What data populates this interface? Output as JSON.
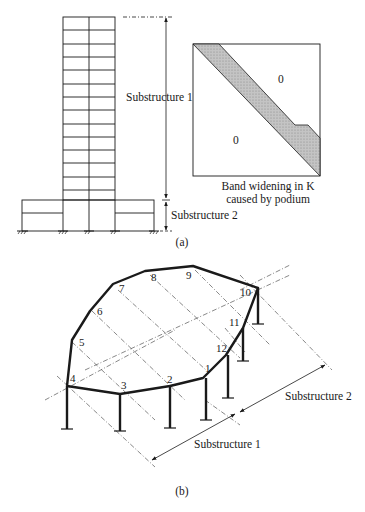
{
  "figure_a": {
    "caption": "(a)",
    "tower": {
      "stories": 14,
      "bays": 2
    },
    "podium": {
      "stories": 2
    },
    "dimension_labels": {
      "substructure_1": "Substructure 1",
      "substructure_2": "Substructure 2"
    },
    "matrix": {
      "zero_upper": "0",
      "zero_lower": "0",
      "caption_line1": "Band widening in K",
      "caption_line2": "caused by podium",
      "band_color": "#b8b8b8"
    }
  },
  "figure_b": {
    "caption": "(b)",
    "node_labels": [
      "1",
      "2",
      "3",
      "4",
      "5",
      "6",
      "7",
      "8",
      "9",
      "10",
      "11",
      "12"
    ],
    "dimension_labels": {
      "substructure_1": "Substructure 1",
      "substructure_2": "Substructure 2"
    }
  },
  "colors": {
    "ink": "#1a1a1a",
    "background": "#ffffff",
    "grid_line": "#555555"
  }
}
